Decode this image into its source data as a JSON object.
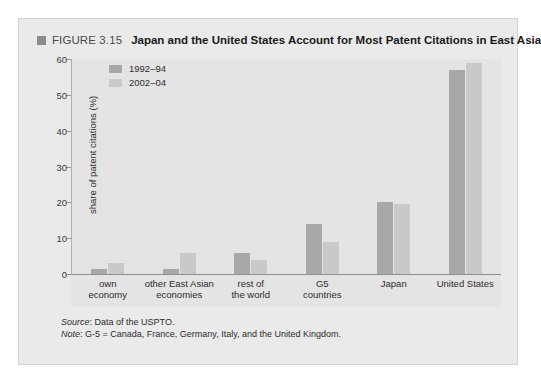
{
  "figure": {
    "marker_icon": "square-marker-icon",
    "number": "FIGURE 3.15",
    "title": "Japan and the United States Account for Most Patent Citations in East Asia"
  },
  "footnotes": {
    "source_label": "Source",
    "source_text": ": Data of the USPTO.",
    "note_label": "Note",
    "note_text": ": G-5 = Canada, France, Germany, Italy, and the United Kingdom."
  },
  "colors": {
    "series_1992_94": "#a8a8a8",
    "series_2002_04": "#c9c9c9",
    "panel_background": "#e4e4e4",
    "frame_background": "#eaeaea",
    "axis": "#8e8e8e"
  },
  "chart_data": {
    "type": "bar",
    "title": "Japan and the United States Account for Most Patent Citations in East Asia",
    "xlabel": "",
    "ylabel": "share of patent citations (%)",
    "ylim": [
      0,
      60
    ],
    "yticks": [
      0,
      10,
      20,
      30,
      40,
      50,
      60
    ],
    "ytick_labels": [
      "0",
      "10",
      "20",
      "30",
      "40",
      "50",
      "60"
    ],
    "grid": false,
    "legend_position": "top-left",
    "categories": [
      "own\neconomy",
      "other East Asian\neconomies",
      "rest of\nthe world",
      "G5\ncountries",
      "Japan",
      "United States"
    ],
    "category_labels": [
      [
        "own",
        "economy"
      ],
      [
        "other East Asian",
        "economies"
      ],
      [
        "rest of",
        "the world"
      ],
      [
        "G5",
        "countries"
      ],
      [
        "Japan",
        ""
      ],
      [
        "United States",
        ""
      ]
    ],
    "series": [
      {
        "name": "1992–94",
        "color": "#a8a8a8",
        "values": [
          1.5,
          1.5,
          6.0,
          14.0,
          20.0,
          57.0
        ]
      },
      {
        "name": "2002–04",
        "color": "#c9c9c9",
        "values": [
          3.0,
          6.0,
          4.0,
          8.8,
          19.5,
          59.0
        ]
      }
    ]
  }
}
